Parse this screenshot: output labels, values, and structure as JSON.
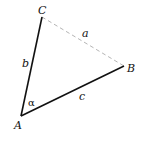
{
  "diagram": {
    "type": "triangle",
    "vertices": {
      "A": {
        "label": "A",
        "x": 21,
        "y": 116
      },
      "B": {
        "label": "B",
        "x": 124,
        "y": 66
      },
      "C": {
        "label": "C",
        "x": 42,
        "y": 17
      }
    },
    "sides": {
      "a": {
        "label": "a",
        "from": "C",
        "to": "B",
        "style": "dashed",
        "color": "#b0b0b0"
      },
      "b": {
        "label": "b",
        "from": "A",
        "to": "C",
        "style": "solid",
        "color": "#111111"
      },
      "c": {
        "label": "c",
        "from": "A",
        "to": "B",
        "style": "solid",
        "color": "#111111"
      }
    },
    "angle": {
      "label": "α",
      "vertex": "A"
    }
  }
}
